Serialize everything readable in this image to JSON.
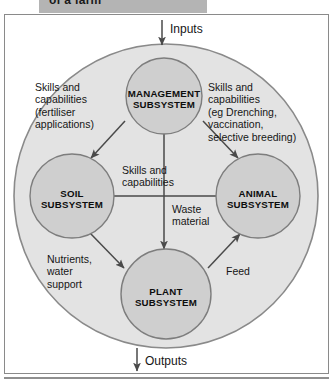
{
  "header": {
    "title": "of a farm"
  },
  "diagram": {
    "inputs_label": "Inputs",
    "outputs_label": "Outputs",
    "colors": {
      "outer_circle_fill": "#e3e3e3",
      "outer_circle_stroke": "#8a8a8a",
      "node_fill": "#cfcfcf",
      "node_stroke": "#7d7d7d",
      "arrow": "#4a4a4a",
      "frame_stroke": "#8a8a8a",
      "header_bar": "#b4b4b4",
      "text": "#161616"
    },
    "nodes": [
      {
        "id": "management",
        "label": "MANAGEMENT\nSUBSYSTEM"
      },
      {
        "id": "soil",
        "label": "SOIL\nSUBSYSTEM"
      },
      {
        "id": "animal",
        "label": "ANIMAL\nSUBSYSTEM"
      },
      {
        "id": "plant",
        "label": "PLANT\nSUBSYSTEM"
      }
    ],
    "flow_labels": [
      {
        "id": "management-to-soil",
        "text": "Skills and\ncapabilities\n(fertiliser\napplications)"
      },
      {
        "id": "management-to-animal",
        "text": "Skills and\ncapabilities\n(eg Drenching,\nvaccination,\nselective breeding)"
      },
      {
        "id": "animal-to-soil",
        "text": "Skills and\ncapabilities"
      },
      {
        "id": "management-to-plant",
        "text": "Waste\nmaterial"
      },
      {
        "id": "soil-to-plant",
        "text": "Nutrients,\nwater\nsupport"
      },
      {
        "id": "plant-to-animal",
        "text": "Feed"
      }
    ]
  }
}
